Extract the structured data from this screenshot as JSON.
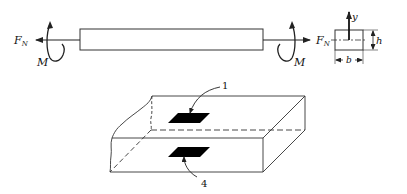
{
  "figure": {
    "top": {
      "left_force_label": "F",
      "left_force_sub": "N",
      "left_moment_label": "M",
      "right_force_label": "F",
      "right_force_sub": "N",
      "right_moment_label": "M"
    },
    "cross_section": {
      "axis_label": "y",
      "height_label": "h",
      "width_label": "b"
    },
    "block": {
      "top_element_label": "1",
      "bottom_element_label": "4"
    }
  },
  "colors": {
    "stroke": "#222222",
    "fill_element": "#000000"
  }
}
